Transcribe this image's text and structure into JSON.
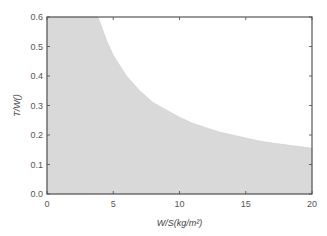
{
  "chart_data": {
    "type": "area",
    "title": "",
    "xlabel": "W/S(kg/m²)",
    "ylabel": "T/W()",
    "xlim": [
      0,
      20
    ],
    "ylim": [
      0,
      0.6
    ],
    "xticks": [
      0,
      5,
      10,
      15,
      20
    ],
    "xtick_labels": [
      "0",
      "5",
      "10",
      "15",
      "20"
    ],
    "yticks": [
      0.0,
      0.1,
      0.2,
      0.3,
      0.4,
      0.5,
      0.6
    ],
    "ytick_labels": [
      "0.0",
      "0.1",
      "0.2",
      "0.3",
      "0.4",
      "0.5",
      "0.6"
    ],
    "grid": false,
    "legend": null,
    "series": [
      {
        "name": "feasible region (shaded below curve)",
        "x": [
          0,
          3.85,
          4.5,
          5,
          6,
          7,
          8,
          9,
          10,
          11,
          12,
          13,
          14,
          15,
          16,
          17,
          18,
          19,
          20
        ],
        "values": [
          0.6,
          0.6,
          0.52,
          0.47,
          0.4,
          0.35,
          0.31,
          0.285,
          0.26,
          0.24,
          0.225,
          0.21,
          0.2,
          0.19,
          0.18,
          0.173,
          0.167,
          0.161,
          0.155
        ]
      }
    ],
    "colors": {
      "fill": "#d9d9d9",
      "frame": "#555555",
      "background": "#ffffff"
    }
  }
}
